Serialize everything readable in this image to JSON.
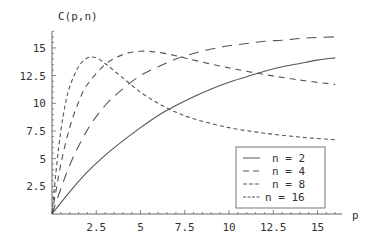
{
  "chart_data": {
    "type": "line",
    "title": "",
    "xlabel": "p",
    "ylabel": "C(p,n)",
    "xlim": [
      0,
      16
    ],
    "ylim": [
      0,
      16.5
    ],
    "x_ticks": [
      2.5,
      5,
      7.5,
      10,
      12.5,
      15
    ],
    "x_tick_labels": [
      "2.5",
      "5",
      "7.5",
      "10",
      "12.5",
      "15"
    ],
    "y_ticks": [
      2.5,
      5,
      7.5,
      10,
      12.5,
      15
    ],
    "y_tick_labels": [
      "2.5",
      "5",
      "7.5",
      "10",
      "12.5",
      "15"
    ],
    "grid": false,
    "legend_position": "lower right",
    "series": [
      {
        "name": "n = 2",
        "dash": "solid",
        "x": [
          0,
          1,
          2,
          3,
          4,
          5,
          6,
          7,
          8,
          9,
          10,
          11,
          12,
          13,
          14,
          15,
          16
        ],
        "y": [
          0,
          2.0,
          3.8,
          5.3,
          6.6,
          7.8,
          8.9,
          9.8,
          10.6,
          11.3,
          11.9,
          12.4,
          12.9,
          13.3,
          13.6,
          13.9,
          14.1
        ]
      },
      {
        "name": "n = 4",
        "dash": "10,7",
        "x": [
          0,
          1,
          2,
          3,
          4,
          5,
          6,
          7,
          8,
          9,
          10,
          11,
          12,
          13,
          14,
          15,
          16
        ],
        "y": [
          0,
          4.4,
          7.6,
          9.8,
          11.3,
          12.5,
          13.3,
          14.0,
          14.5,
          14.9,
          15.2,
          15.4,
          15.6,
          15.7,
          15.85,
          15.95,
          16.0
        ]
      },
      {
        "name": "n = 8",
        "dash": "6,5",
        "x": [
          0,
          0.5,
          1,
          1.5,
          2,
          3,
          4,
          5,
          6,
          7,
          8,
          10,
          12,
          14,
          16
        ],
        "y": [
          0,
          4.5,
          7.8,
          10.1,
          11.7,
          13.5,
          14.4,
          14.7,
          14.6,
          14.3,
          13.9,
          13.2,
          12.6,
          12.1,
          11.7
        ]
      },
      {
        "name": "n = 16",
        "dash": "4,3",
        "x": [
          0,
          0.25,
          0.5,
          0.75,
          1,
          1.5,
          2,
          2.5,
          3,
          4,
          5,
          6,
          7,
          8,
          10,
          12,
          14,
          16
        ],
        "y": [
          0,
          4.2,
          7.5,
          9.9,
          11.5,
          13.3,
          14.1,
          14.1,
          13.6,
          12.3,
          11.0,
          10.0,
          9.2,
          8.6,
          7.8,
          7.3,
          6.95,
          6.7
        ]
      }
    ]
  },
  "legend": {
    "items": [
      {
        "label": "n = 2"
      },
      {
        "label": "n = 4"
      },
      {
        "label": "n = 8"
      },
      {
        "label": "n = 16"
      }
    ]
  },
  "colors": {
    "line": "#555555",
    "axis": "#666666",
    "text": "#333333"
  }
}
